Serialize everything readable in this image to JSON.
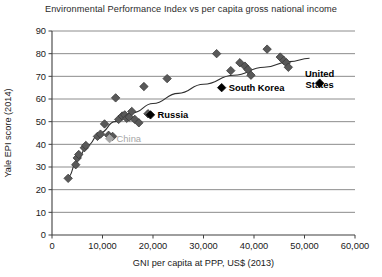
{
  "chart_data": {
    "type": "scatter",
    "title": "Environmental Performance Index vs per capita gross national income",
    "xlabel": "GNI per capita at PPP, US$ (2013)",
    "ylabel": "Yale EPI score (2014)",
    "xlim": [
      0,
      60000
    ],
    "ylim": [
      0,
      90
    ],
    "xticks": [
      0,
      10000,
      20000,
      30000,
      40000,
      50000,
      60000
    ],
    "xticklabels": [
      "0",
      "10,000",
      "20,000",
      "30,000",
      "40,000",
      "50,000",
      "60,000"
    ],
    "yticks": [
      0,
      10,
      20,
      30,
      40,
      50,
      60,
      70,
      80,
      90
    ],
    "yticklabels": [
      "0",
      "10",
      "20",
      "30",
      "40",
      "50",
      "60",
      "70",
      "80",
      "90"
    ],
    "grid": "horizontal",
    "legend": "none",
    "marker": "diamond",
    "marker_color": "#595959",
    "highlight_color": "#000000",
    "muted_color": "#a6a6a6",
    "points": [
      {
        "x": 3200,
        "y": 25.0
      },
      {
        "x": 4700,
        "y": 31.0
      },
      {
        "x": 5000,
        "y": 34.0
      },
      {
        "x": 5300,
        "y": 35.5
      },
      {
        "x": 6400,
        "y": 38.5
      },
      {
        "x": 6700,
        "y": 39.5
      },
      {
        "x": 9000,
        "y": 43.5
      },
      {
        "x": 9600,
        "y": 44.5
      },
      {
        "x": 10400,
        "y": 49.0
      },
      {
        "x": 11200,
        "y": 44.0
      },
      {
        "x": 12000,
        "y": 43.5
      },
      {
        "x": 12600,
        "y": 60.5
      },
      {
        "x": 13200,
        "y": 51.0
      },
      {
        "x": 13900,
        "y": 52.5
      },
      {
        "x": 14400,
        "y": 53.0
      },
      {
        "x": 14800,
        "y": 51.5
      },
      {
        "x": 15300,
        "y": 52.0
      },
      {
        "x": 15800,
        "y": 54.5
      },
      {
        "x": 16400,
        "y": 51.0
      },
      {
        "x": 17200,
        "y": 49.5
      },
      {
        "x": 18200,
        "y": 65.5
      },
      {
        "x": 19000,
        "y": 53.5
      },
      {
        "x": 22800,
        "y": 69.0
      },
      {
        "x": 32600,
        "y": 80.0
      },
      {
        "x": 35400,
        "y": 72.5
      },
      {
        "x": 37200,
        "y": 76.0
      },
      {
        "x": 38200,
        "y": 74.5
      },
      {
        "x": 38800,
        "y": 73.0
      },
      {
        "x": 39400,
        "y": 70.5
      },
      {
        "x": 42600,
        "y": 82.0
      },
      {
        "x": 45200,
        "y": 78.5
      },
      {
        "x": 45900,
        "y": 77.0
      },
      {
        "x": 46400,
        "y": 76.0
      },
      {
        "x": 46800,
        "y": 74.0
      }
    ],
    "trend_line": [
      {
        "x": 3200,
        "y": 25.5
      },
      {
        "x": 5000,
        "y": 33.0
      },
      {
        "x": 7000,
        "y": 39.5
      },
      {
        "x": 9500,
        "y": 45.0
      },
      {
        "x": 12500,
        "y": 50.0
      },
      {
        "x": 16000,
        "y": 54.0
      },
      {
        "x": 20000,
        "y": 58.0
      },
      {
        "x": 25000,
        "y": 62.5
      },
      {
        "x": 30000,
        "y": 66.5
      },
      {
        "x": 36000,
        "y": 70.5
      },
      {
        "x": 42000,
        "y": 74.0
      },
      {
        "x": 47000,
        "y": 76.5
      },
      {
        "x": 51000,
        "y": 78.0
      }
    ],
    "annotations": [
      {
        "label": "South Korea",
        "x": 33600,
        "y": 65.0,
        "marker_x": 33600,
        "marker_y": 65.0,
        "style": "highlight",
        "text_dx": 7,
        "text_dy": 3.2,
        "lines": [
          "South Korea"
        ]
      },
      {
        "label": "United States",
        "x": 53000,
        "y": 67.0,
        "marker_x": 53000,
        "marker_y": 67.0,
        "style": "highlight",
        "text_dx": 0,
        "text_dy": -6.0,
        "lines": [
          "United",
          "States"
        ],
        "align": "middle"
      },
      {
        "label": "Russia",
        "x": 19500,
        "y": 53.0,
        "marker_x": 19500,
        "marker_y": 53.0,
        "style": "highlight",
        "text_dx": 7,
        "text_dy": 3.2,
        "lines": [
          "Russia"
        ]
      },
      {
        "label": "China",
        "x": 11400,
        "y": 42.5,
        "marker_x": 11400,
        "marker_y": 42.5,
        "style": "muted",
        "text_dx": 7,
        "text_dy": 3.2,
        "lines": [
          "China"
        ]
      }
    ]
  }
}
